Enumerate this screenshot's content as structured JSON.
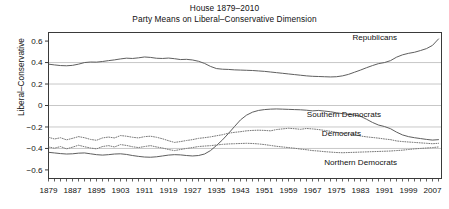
{
  "figure": {
    "title": "House 1879–2010",
    "subtitle": "Party Means on Liberal–Conservative Dimension"
  },
  "axes": {
    "ylabel": "Liberal–Conservative",
    "xlabel": "",
    "yticks": [
      "0.6",
      "0.4",
      "0.2",
      "0",
      "−0.2",
      "−0.4",
      "−0.6"
    ],
    "xticks": [
      "1879",
      "1887",
      "1895",
      "1903",
      "1911",
      "1919",
      "1927",
      "1935",
      "1943",
      "1951",
      "1959",
      "1967",
      "1975",
      "1983",
      "1991",
      "1999",
      "2007"
    ]
  },
  "annotations": {
    "republicans": "Republicans",
    "southern_democrats": "Southern Democrats",
    "democrats": "Democrats",
    "northern_democrats": "Northern Democrats"
  },
  "chart_data": {
    "type": "line",
    "title": "House 1879–2010",
    "subtitle": "Party Means on Liberal–Conservative Dimension",
    "xlabel": "",
    "ylabel": "Liberal–Conservative",
    "xlim": [
      1879,
      2010
    ],
    "ylim": [
      -0.68,
      0.68
    ],
    "grid": "horizontal",
    "legend": "inline-annotations",
    "x": [
      1879,
      1881,
      1883,
      1885,
      1887,
      1889,
      1891,
      1893,
      1895,
      1897,
      1899,
      1901,
      1903,
      1905,
      1907,
      1909,
      1911,
      1913,
      1915,
      1917,
      1919,
      1921,
      1923,
      1925,
      1927,
      1929,
      1931,
      1933,
      1935,
      1937,
      1939,
      1941,
      1943,
      1945,
      1947,
      1949,
      1951,
      1953,
      1955,
      1957,
      1959,
      1961,
      1963,
      1965,
      1967,
      1969,
      1971,
      1973,
      1975,
      1977,
      1979,
      1981,
      1983,
      1985,
      1987,
      1989,
      1991,
      1993,
      1995,
      1997,
      1999,
      2001,
      2003,
      2005,
      2007,
      2009
    ],
    "series": [
      {
        "name": "Republicans",
        "style": "solid",
        "color": "#555555",
        "values": [
          0.385,
          0.378,
          0.372,
          0.37,
          0.374,
          0.385,
          0.4,
          0.405,
          0.404,
          0.41,
          0.418,
          0.425,
          0.434,
          0.441,
          0.438,
          0.444,
          0.452,
          0.448,
          0.44,
          0.438,
          0.442,
          0.436,
          0.428,
          0.43,
          0.424,
          0.412,
          0.392,
          0.364,
          0.344,
          0.338,
          0.336,
          0.332,
          0.33,
          0.328,
          0.326,
          0.322,
          0.318,
          0.312,
          0.306,
          0.3,
          0.294,
          0.288,
          0.282,
          0.276,
          0.272,
          0.27,
          0.268,
          0.266,
          0.268,
          0.276,
          0.29,
          0.31,
          0.33,
          0.352,
          0.372,
          0.39,
          0.4,
          0.418,
          0.45,
          0.472,
          0.486,
          0.496,
          0.512,
          0.53,
          0.56,
          0.62
        ]
      },
      {
        "name": "Southern Democrats",
        "style": "solid",
        "color": "#555555",
        "values": [
          -0.436,
          -0.442,
          -0.448,
          -0.452,
          -0.45,
          -0.444,
          -0.442,
          -0.45,
          -0.458,
          -0.462,
          -0.458,
          -0.452,
          -0.45,
          -0.456,
          -0.466,
          -0.474,
          -0.48,
          -0.482,
          -0.478,
          -0.47,
          -0.462,
          -0.458,
          -0.46,
          -0.466,
          -0.47,
          -0.466,
          -0.452,
          -0.42,
          -0.372,
          -0.32,
          -0.26,
          -0.196,
          -0.134,
          -0.09,
          -0.062,
          -0.046,
          -0.038,
          -0.034,
          -0.032,
          -0.034,
          -0.036,
          -0.038,
          -0.04,
          -0.044,
          -0.05,
          -0.046,
          -0.052,
          -0.058,
          -0.068,
          -0.076,
          -0.082,
          -0.09,
          -0.1,
          -0.128,
          -0.158,
          -0.182,
          -0.196,
          -0.216,
          -0.248,
          -0.274,
          -0.29,
          -0.3,
          -0.308,
          -0.316,
          -0.322,
          -0.318
        ]
      },
      {
        "name": "Democrats",
        "style": "dotted",
        "color": "#777777",
        "values": [
          -0.296,
          -0.312,
          -0.3,
          -0.32,
          -0.306,
          -0.29,
          -0.3,
          -0.316,
          -0.324,
          -0.302,
          -0.294,
          -0.302,
          -0.28,
          -0.286,
          -0.296,
          -0.302,
          -0.29,
          -0.286,
          -0.296,
          -0.31,
          -0.328,
          -0.344,
          -0.336,
          -0.326,
          -0.318,
          -0.306,
          -0.3,
          -0.292,
          -0.282,
          -0.272,
          -0.258,
          -0.25,
          -0.244,
          -0.236,
          -0.232,
          -0.23,
          -0.232,
          -0.236,
          -0.224,
          -0.218,
          -0.212,
          -0.216,
          -0.222,
          -0.214,
          -0.218,
          -0.224,
          -0.232,
          -0.24,
          -0.25,
          -0.258,
          -0.264,
          -0.272,
          -0.284,
          -0.292,
          -0.298,
          -0.304,
          -0.312,
          -0.318,
          -0.33,
          -0.336,
          -0.34,
          -0.344,
          -0.348,
          -0.352,
          -0.356,
          -0.352
        ]
      },
      {
        "name": "Northern Democrats",
        "style": "dotted",
        "color": "#777777",
        "values": [
          -0.386,
          -0.398,
          -0.382,
          -0.404,
          -0.388,
          -0.37,
          -0.384,
          -0.396,
          -0.404,
          -0.382,
          -0.374,
          -0.386,
          -0.364,
          -0.372,
          -0.384,
          -0.392,
          -0.382,
          -0.374,
          -0.386,
          -0.396,
          -0.41,
          -0.42,
          -0.41,
          -0.4,
          -0.392,
          -0.382,
          -0.378,
          -0.374,
          -0.368,
          -0.362,
          -0.358,
          -0.356,
          -0.354,
          -0.352,
          -0.354,
          -0.358,
          -0.364,
          -0.372,
          -0.38,
          -0.386,
          -0.392,
          -0.398,
          -0.406,
          -0.412,
          -0.42,
          -0.424,
          -0.43,
          -0.434,
          -0.438,
          -0.44,
          -0.438,
          -0.436,
          -0.434,
          -0.432,
          -0.43,
          -0.428,
          -0.426,
          -0.424,
          -0.42,
          -0.416,
          -0.41,
          -0.404,
          -0.4,
          -0.396,
          -0.392,
          -0.386
        ]
      }
    ]
  }
}
